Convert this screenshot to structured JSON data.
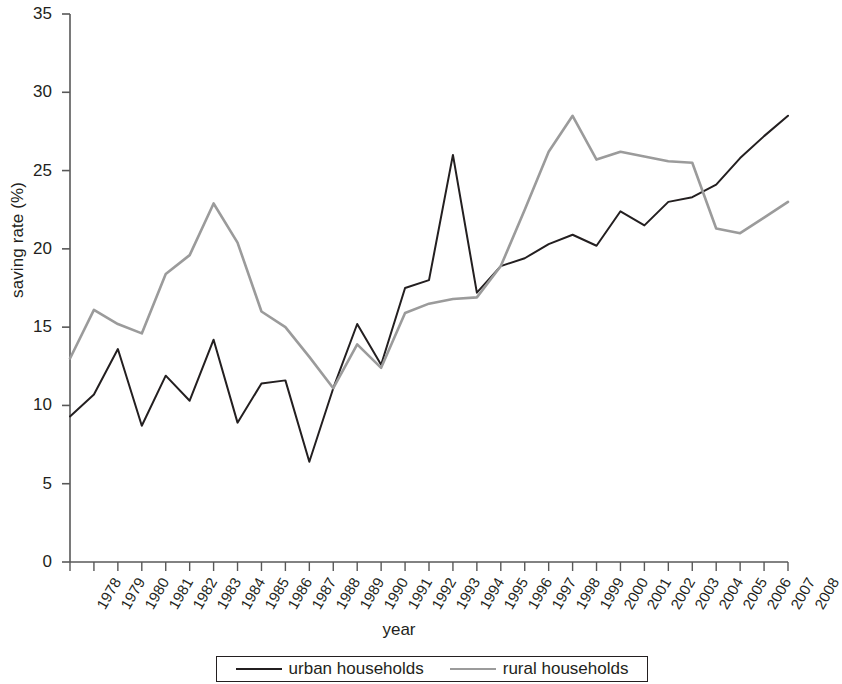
{
  "chart_data": {
    "type": "line",
    "title": "",
    "xlabel": "year",
    "ylabel": "saving rate (%)",
    "ylim": [
      0,
      35
    ],
    "yticks": [
      0,
      5,
      10,
      15,
      20,
      25,
      30,
      35
    ],
    "grid": false,
    "legend_position": "bottom",
    "categories": [
      "1978",
      "1979",
      "1980",
      "1981",
      "1982",
      "1983",
      "1984",
      "1985",
      "1986",
      "1987",
      "1988",
      "1989",
      "1990",
      "1991",
      "1992",
      "1993",
      "1994",
      "1995",
      "1996",
      "1997",
      "1998",
      "1999",
      "2000",
      "2001",
      "2002",
      "2003",
      "2004",
      "2005",
      "2006",
      "2007",
      "2008"
    ],
    "series": [
      {
        "name": "urban households",
        "color": "#231f20",
        "values": [
          9.3,
          10.7,
          13.6,
          8.7,
          11.9,
          10.3,
          14.2,
          8.9,
          11.4,
          11.6,
          6.4,
          11.1,
          15.2,
          12.6,
          17.5,
          18.0,
          26.0,
          17.2,
          18.9,
          19.4,
          20.3,
          20.9,
          20.2,
          22.4,
          21.5,
          23.0,
          23.3,
          24.1,
          25.8,
          27.2,
          28.5
        ]
      },
      {
        "name": "rural households",
        "color": "#9b9b9b",
        "values": [
          13.0,
          16.1,
          15.2,
          14.6,
          18.4,
          19.6,
          22.9,
          20.4,
          16.0,
          15.0,
          13.1,
          11.1,
          13.9,
          12.4,
          15.9,
          16.5,
          16.8,
          16.9,
          18.9,
          22.5,
          26.2,
          28.5,
          25.7,
          26.2,
          25.9,
          25.6,
          25.5,
          21.3,
          21.0,
          22.0,
          23.0
        ]
      }
    ]
  },
  "legend": {
    "items": [
      {
        "label": "urban households",
        "style": "urban"
      },
      {
        "label": "rural households",
        "style": "rural"
      }
    ]
  },
  "colors": {
    "urban": "#231f20",
    "rural": "#9b9b9b",
    "axis": "#585858",
    "text": "#231f20"
  },
  "icons": {
    "urban_line": "line-solid-black-icon",
    "rural_line": "line-solid-gray-icon"
  }
}
